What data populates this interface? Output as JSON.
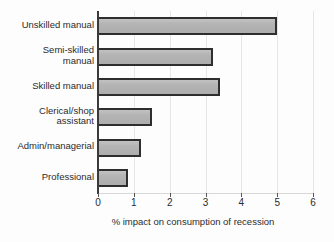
{
  "chart_data": {
    "type": "bar",
    "orientation": "horizontal",
    "title": "",
    "xlabel": "% impact on consumption of recession",
    "ylabel": "",
    "xlim": [
      0,
      6
    ],
    "xticks": [
      "0",
      "1",
      "2",
      "3",
      "4",
      "5",
      "6"
    ],
    "grid": true,
    "legend": "none",
    "categories": [
      "Unskilled manual",
      "Semi-skilled\nmanual",
      "Skilled manual",
      "Clerical/shop\nassistant",
      "Admin/managerial",
      "Professional"
    ],
    "values": [
      5.0,
      3.2,
      3.4,
      1.5,
      1.2,
      0.85
    ],
    "colors": {
      "bar_fill": "#b4b4b4",
      "bar_border": "#2e2e2e",
      "gridline": "#e6e6e6",
      "axis": "#3a3a3a",
      "text": "#2b2b2b",
      "background": "#fdfdfd"
    }
  }
}
